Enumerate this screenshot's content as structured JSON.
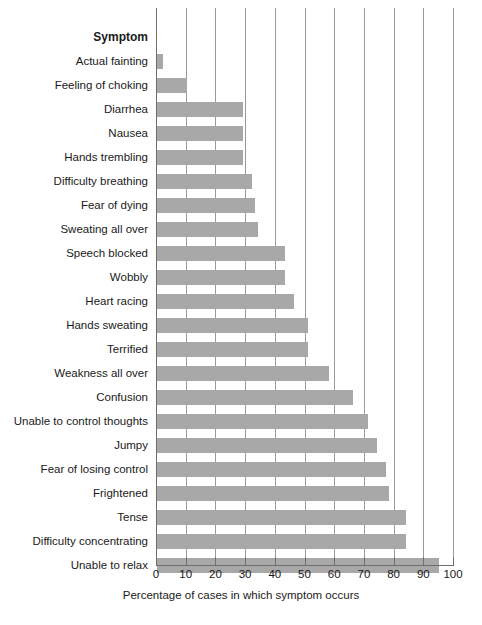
{
  "chart_data": {
    "type": "bar",
    "orientation": "horizontal",
    "title": "",
    "category_header": "Symptom",
    "xlabel": "Percentage of cases in which symptom occurs",
    "ylabel": "",
    "xlim": [
      0,
      100
    ],
    "xticks": [
      0,
      10,
      20,
      30,
      40,
      50,
      60,
      70,
      80,
      90,
      100
    ],
    "xtick_labels": [
      "0",
      "10",
      "20",
      "30",
      "40",
      "50",
      "60",
      "70",
      "80",
      "90",
      "100"
    ],
    "grid": true,
    "grid_axis": "x",
    "legend": false,
    "bar_color": "#a8a8a8",
    "axis_color": "#6e6e6e",
    "categories": [
      "Actual fainting",
      "Feeling of choking",
      "Diarrhea",
      "Nausea",
      "Hands trembling",
      "Difficulty breathing",
      "Fear of dying",
      "Sweating all over",
      "Speech blocked",
      "Wobbly",
      "Heart racing",
      "Hands sweating",
      "Terrified",
      "Weakness all over",
      "Confusion",
      "Unable to control thoughts",
      "Jumpy",
      "Fear of losing control",
      "Frightened",
      "Tense",
      "Difficulty concentrating",
      "Unable to relax"
    ],
    "values": [
      2,
      10,
      29,
      29,
      29,
      32,
      33,
      34,
      43,
      43,
      46,
      51,
      51,
      58,
      66,
      71,
      74,
      77,
      78,
      84,
      84,
      95
    ]
  }
}
